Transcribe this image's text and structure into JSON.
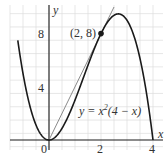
{
  "chart_data": {
    "type": "line",
    "title": "",
    "xlabel": "x",
    "ylabel": "y",
    "xlim": [
      -1.5,
      4.4
    ],
    "ylim": [
      -0.8,
      10.2
    ],
    "x_ticks": [
      0,
      2,
      4
    ],
    "x_tick_labels": [
      "0",
      "2",
      "4"
    ],
    "y_ticks": [
      4,
      8
    ],
    "y_tick_labels": [
      "4",
      "8"
    ],
    "grid": true,
    "series": [
      {
        "name": "y = x^2(4 - x)",
        "kind": "curve",
        "equation": "x^2(4-x)",
        "x": [
          -1.0,
          -0.5,
          0,
          0.5,
          1,
          1.5,
          2,
          2.5,
          2.667,
          3,
          3.5,
          4
        ],
        "y": [
          5.0,
          1.125,
          0,
          0.875,
          3,
          5.625,
          8,
          9.375,
          9.48,
          9,
          6.125,
          0
        ]
      },
      {
        "name": "line through origin and (2,8)",
        "kind": "line",
        "equation": "4x",
        "x": [
          0,
          2.5
        ],
        "y": [
          0,
          10
        ]
      }
    ],
    "annotations": [
      {
        "text": "(2, 8)",
        "x": 2,
        "y": 8,
        "marker": "dot"
      },
      {
        "text": "y = x²(4 − x)",
        "x": 2.6,
        "y": 2.2
      }
    ]
  },
  "labels": {
    "x_axis": "x",
    "y_axis": "y",
    "origin": "0",
    "x2": "2",
    "x4": "4",
    "y4": "4",
    "y8": "8",
    "point": "(2, 8)",
    "eq_prefix": "y = x",
    "eq_exp": "2",
    "eq_suffix": "(4 − x)"
  },
  "colors": {
    "curve": "#1a1a1a",
    "tangent": "#8a8a8a",
    "axes": "#1a1a1a",
    "grid": "#dcdcdc",
    "text": "#333333"
  }
}
